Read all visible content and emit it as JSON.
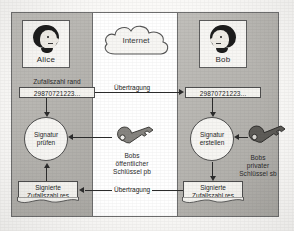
{
  "diagram": {
    "network": {
      "cloud_label": "Internet"
    },
    "parties": {
      "left": {
        "name": "Alice",
        "avatar": "person-face-icon"
      },
      "right": {
        "name": "Bob",
        "avatar": "person-face-icon"
      }
    },
    "left_column": {
      "random_caption": "Zufallszahl rand",
      "random_value": "29870721223...",
      "operation": "Signatur\nprüfen",
      "operation_line1": "Signatur",
      "operation_line2": "prüfen",
      "result_line1": "Signierte",
      "result_line2": "Zufallszahl res"
    },
    "right_column": {
      "random_value": "29870721223...",
      "operation_line1": "Signatur",
      "operation_line2": "erstellen",
      "result_line1": "Signierte",
      "result_line2": "Zufallszahl res"
    },
    "transmissions": {
      "top": "Übertragung",
      "bottom": "Übertragung"
    },
    "keys": {
      "public": {
        "icon": "key-icon",
        "line1": "Bobs",
        "line2": "öffentlicher",
        "line3": "Schlüssel pb"
      },
      "private": {
        "icon": "key-icon",
        "line1": "Bobs",
        "line2": "privater",
        "line3": "Schlüssel sb"
      }
    },
    "colors": {
      "panel_gray": "#b4b2ad",
      "paper_white": "#f4f3ef",
      "ink": "#2c2c2c",
      "hair_black": "#1d1d1d",
      "key_gray": "#6f6d68"
    }
  }
}
